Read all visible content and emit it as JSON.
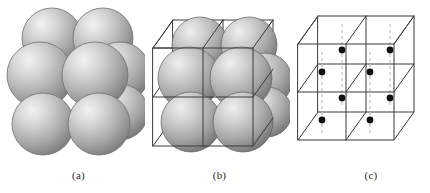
{
  "figure": {
    "background_color": "#ffffff",
    "width": 430,
    "height": 193,
    "panels": [
      {
        "id": "a",
        "caption": "(a)",
        "name": "hard-sphere-unit-cell-model",
        "description": "Hard-sphere unit cell model: shaded atoms drawn at full atomic radius so that neighbouring atoms touch.",
        "style": "hard-sphere",
        "sphere_fill_light": "#e8e8e8",
        "sphere_fill_mid": "#b4b4b4",
        "sphere_fill_dark": "#7b7b7b",
        "sphere_outline": "#6e6e6e",
        "spheres": [
          {
            "cx": 52,
            "cy": 38,
            "r": 30,
            "layer": "back-top"
          },
          {
            "cx": 103,
            "cy": 38,
            "r": 30,
            "layer": "back-top"
          },
          {
            "cx": 120,
            "cy": 72,
            "r": 30,
            "layer": "right-mid"
          },
          {
            "cx": 40,
            "cy": 75,
            "r": 33,
            "layer": "front-top"
          },
          {
            "cx": 95,
            "cy": 75,
            "r": 33,
            "layer": "front-top"
          },
          {
            "cx": 120,
            "cy": 112,
            "r": 28,
            "layer": "right-low"
          },
          {
            "cx": 43,
            "cy": 124,
            "r": 31,
            "layer": "front-bottom"
          },
          {
            "cx": 99,
            "cy": 124,
            "r": 31,
            "layer": "front-bottom"
          }
        ]
      },
      {
        "id": "b",
        "caption": "(b)",
        "name": "sphere-in-wireframe-cell-model",
        "description": "Aggregate of many cells: shaded spheres shown inside a 2x2 array of wireframe cubic unit cells.",
        "style": "spheres-with-wireframe",
        "wireframe_color": "#3a3a3a",
        "wireframe_width": 1,
        "sphere_fill_light": "#e4e4e4",
        "sphere_fill_mid": "#b0b0b0",
        "sphere_fill_dark": "#777777",
        "sphere_outline": "#5f5f5f",
        "grid_divisions": 2,
        "spheres": [
          {
            "cx": 55,
            "cy": 45,
            "r": 28,
            "layer": "back-top"
          },
          {
            "cx": 104,
            "cy": 45,
            "r": 28,
            "layer": "back-top"
          },
          {
            "cx": 120,
            "cy": 80,
            "r": 27,
            "layer": "right-mid"
          },
          {
            "cx": 44,
            "cy": 78,
            "r": 31,
            "layer": "front-top"
          },
          {
            "cx": 96,
            "cy": 78,
            "r": 31,
            "layer": "front-top"
          },
          {
            "cx": 122,
            "cy": 112,
            "r": 25,
            "layer": "right-low"
          },
          {
            "cx": 46,
            "cy": 122,
            "r": 30,
            "layer": "front-bottom"
          },
          {
            "cx": 98,
            "cy": 122,
            "r": 30,
            "layer": "front-bottom"
          }
        ]
      },
      {
        "id": "c",
        "caption": "(c)",
        "name": "reduced-sphere-lattice-point-model",
        "description": "Reduced-sphere model: atom centres shown as small filled dots joined by light dashed vertical lines within the same 2x2 wireframe cell array.",
        "style": "lattice-points",
        "wireframe_color": "#3a3a3a",
        "wireframe_width": 1,
        "dot_color": "#111111",
        "dot_radius": 3.2,
        "dashed_line_color": "#b9b9b9",
        "dash_pattern": "3,3",
        "grid_divisions": 2,
        "lattice_dots": [
          {
            "x": 44,
            "cy": 50,
            "name": "dot-back-left-upper"
          },
          {
            "x": 96,
            "cy": 50,
            "name": "dot-back-right-upper"
          },
          {
            "x": 30,
            "cy": 72,
            "name": "dot-front-left-upper"
          },
          {
            "x": 82,
            "cy": 72,
            "name": "dot-front-right-upper"
          },
          {
            "x": 44,
            "cy": 100,
            "name": "dot-back-left-lower"
          },
          {
            "x": 96,
            "cy": 100,
            "name": "dot-back-right-lower"
          },
          {
            "x": 30,
            "cy": 122,
            "name": "dot-front-left-lower"
          },
          {
            "x": 82,
            "cy": 122,
            "name": "dot-front-right-lower"
          }
        ],
        "dashed_lines": [
          {
            "x": 44,
            "y1": 28,
            "y2": 112,
            "name": "dash-back-left"
          },
          {
            "x": 96,
            "y1": 28,
            "y2": 112,
            "name": "dash-back-right"
          },
          {
            "x": 30,
            "y1": 50,
            "y2": 148,
            "name": "dash-front-left"
          },
          {
            "x": 82,
            "y1": 50,
            "y2": 148,
            "name": "dash-front-right"
          }
        ]
      }
    ]
  }
}
